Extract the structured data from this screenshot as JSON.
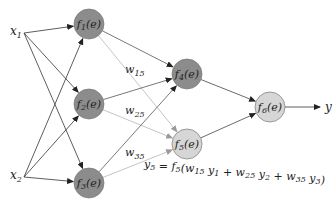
{
  "diagram": {
    "inputs": [
      {
        "id": "x1",
        "label": "x",
        "sub": "1",
        "x": 18,
        "y": 33
      },
      {
        "id": "x2",
        "label": "x",
        "sub": "2",
        "x": 18,
        "y": 177
      }
    ],
    "nodes": [
      {
        "id": "f1",
        "fn": "f",
        "sub": "1",
        "arg": "(e)",
        "cx": 89,
        "cy": 24,
        "fill": "#8c8c8c"
      },
      {
        "id": "f2",
        "fn": "f",
        "sub": "2",
        "arg": "(e)",
        "cx": 89,
        "cy": 104,
        "fill": "#8c8c8c"
      },
      {
        "id": "f3",
        "fn": "f",
        "sub": "3",
        "arg": "(e)",
        "cx": 89,
        "cy": 183,
        "fill": "#8c8c8c"
      },
      {
        "id": "f4",
        "fn": "f",
        "sub": "4",
        "arg": "(e)",
        "cx": 187,
        "cy": 74,
        "fill": "#8c8c8c"
      },
      {
        "id": "f5",
        "fn": "f",
        "sub": "5",
        "arg": "(e)",
        "cx": 187,
        "cy": 144,
        "fill": "#d6d6d6"
      },
      {
        "id": "f6",
        "fn": "f",
        "sub": "6",
        "arg": "(e)",
        "cx": 270,
        "cy": 107,
        "fill": "#d6d6d6"
      }
    ],
    "node_radius": 15,
    "output": {
      "label": "y",
      "x": 325,
      "y": 107
    },
    "weights": [
      {
        "label": "w",
        "sub": "15",
        "x": 125,
        "y": 73
      },
      {
        "label": "w",
        "sub": "25",
        "x": 125,
        "y": 114
      },
      {
        "label": "w",
        "sub": "35",
        "x": 125,
        "y": 156
      }
    ],
    "edges": [
      {
        "from": "x1",
        "to": "f1",
        "color": "#333333"
      },
      {
        "from": "x1",
        "to": "f2",
        "color": "#333333"
      },
      {
        "from": "x1",
        "to": "f3",
        "color": "#333333"
      },
      {
        "from": "x2",
        "to": "f1",
        "color": "#333333"
      },
      {
        "from": "x2",
        "to": "f2",
        "color": "#333333"
      },
      {
        "from": "x2",
        "to": "f3",
        "color": "#333333"
      },
      {
        "from": "f1",
        "to": "f4",
        "color": "#555555"
      },
      {
        "from": "f1",
        "to": "f5",
        "color": "#b5b5b5"
      },
      {
        "from": "f2",
        "to": "f4",
        "color": "#555555"
      },
      {
        "from": "f2",
        "to": "f5",
        "color": "#b5b5b5"
      },
      {
        "from": "f3",
        "to": "f4",
        "color": "#555555"
      },
      {
        "from": "f3",
        "to": "f5",
        "color": "#b5b5b5"
      },
      {
        "from": "f4",
        "to": "f6",
        "color": "#444444"
      },
      {
        "from": "f5",
        "to": "f6",
        "color": "#444444"
      },
      {
        "from": "f6",
        "to": "y",
        "color": "#333333"
      }
    ],
    "equation": {
      "text": "y5 = f5(w15 y1 + w25 y2 + w35 y3)",
      "x": 144,
      "y": 168
    }
  }
}
